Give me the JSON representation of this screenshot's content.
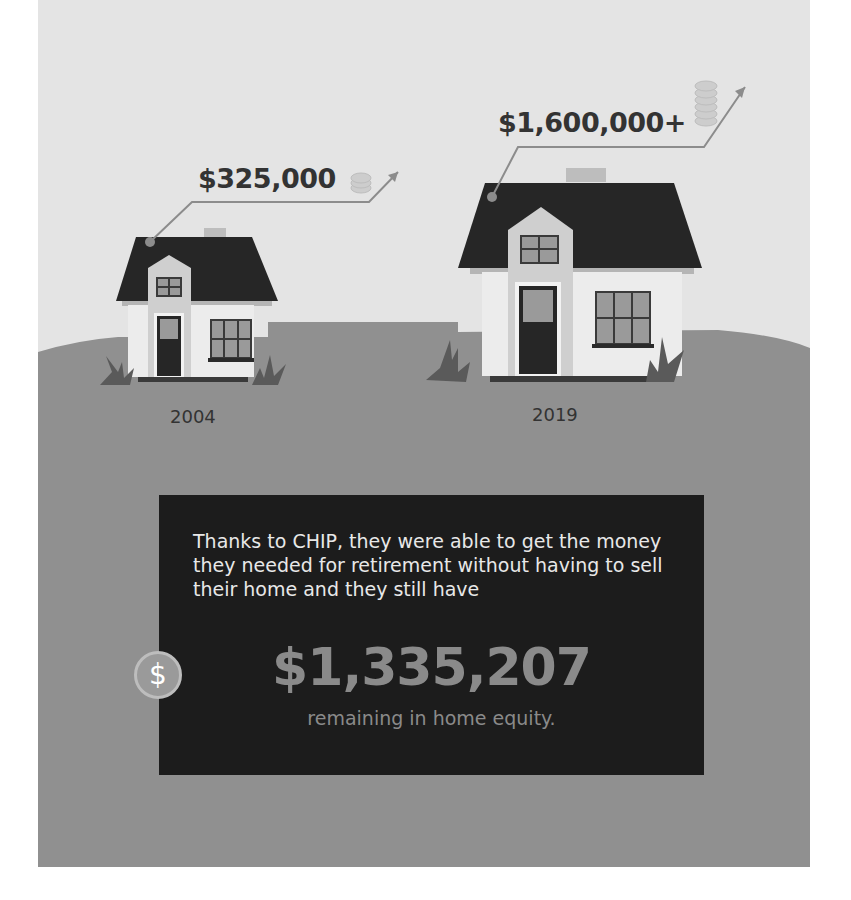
{
  "infographic": {
    "colors": {
      "sky": "#e4e4e4",
      "ground": "#909090",
      "roof": "#262626",
      "wall": "#e9e9e9",
      "wall_shade": "#c8c8c8",
      "text_box": "#1c1c1c",
      "accent_gray": "#8a8a8a"
    },
    "houses": [
      {
        "year": "2004",
        "price": "$325,000",
        "icon": "coin-stack-icon",
        "trend": "arrow-up-right-icon"
      },
      {
        "year": "2019",
        "price": "$1,600,000+",
        "icon": "coin-stack-icon",
        "trend": "arrow-up-right-icon"
      }
    ],
    "callout": {
      "text": "Thanks to CHIP, they were able to get the money they needed for retirement without having to sell their home and they still have",
      "amount": "$1,335,207",
      "caption": "remaining in home equity.",
      "badge_symbol": "$"
    }
  }
}
